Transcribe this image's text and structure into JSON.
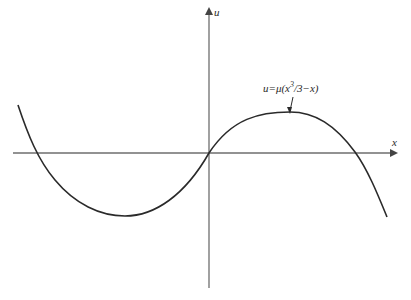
{
  "diagram": {
    "type": "function-plot",
    "axes": {
      "x_label": "x",
      "y_label": "u"
    },
    "curve": {
      "equation_label_parts": {
        "prefix": "u=μ(x",
        "exponent": "3",
        "suffix": "/3−x)"
      },
      "description": "cubic curve u = μ(x³/3 − x) passing through origin"
    },
    "colors": {
      "axis": "#6e6e6e",
      "curve": "#2a2a2a",
      "background": "#ffffff"
    }
  }
}
